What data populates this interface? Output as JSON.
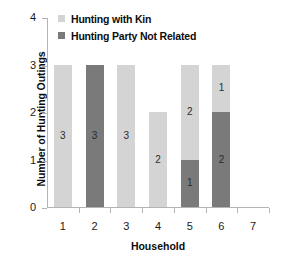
{
  "chart_data": {
    "type": "bar",
    "subtype": "stacked-bar",
    "title": "",
    "xlabel": "Household",
    "ylabel": "Number of Hunting Outings",
    "categories": [
      "1",
      "2",
      "3",
      "4",
      "5",
      "6",
      "7"
    ],
    "series": [
      {
        "name": "Hunting Party Not Related",
        "color": "#7a7a7a",
        "values": [
          0,
          3,
          0,
          0,
          1,
          2,
          0
        ]
      },
      {
        "name": "Hunting with Kin",
        "color": "#d4d4d4",
        "values": [
          3,
          0,
          3,
          2,
          2,
          1,
          0
        ]
      }
    ],
    "stack_order_bottom_to_top": [
      "Hunting Party Not Related",
      "Hunting with Kin"
    ],
    "ylim": [
      0,
      4
    ],
    "yticks": [
      "0",
      "1",
      "2",
      "3",
      "4"
    ],
    "xticks": [
      "1",
      "2",
      "3",
      "4",
      "5",
      "6",
      "7"
    ],
    "grid": false,
    "legend_position": "top-left-inside",
    "bar_totals": [
      3,
      3,
      3,
      2,
      3,
      3,
      0
    ],
    "segment_labels": [
      [
        {
          "value": "3",
          "series": "Hunting with Kin"
        }
      ],
      [
        {
          "value": "3",
          "series": "Hunting Party Not Related"
        }
      ],
      [
        {
          "value": "3",
          "series": "Hunting with Kin"
        }
      ],
      [
        {
          "value": "2",
          "series": "Hunting with Kin"
        }
      ],
      [
        {
          "value": "1",
          "series": "Hunting Party Not Related"
        },
        {
          "value": "2",
          "series": "Hunting with Kin"
        }
      ],
      [
        {
          "value": "2",
          "series": "Hunting Party Not Related"
        },
        {
          "value": "1",
          "series": "Hunting with Kin"
        }
      ],
      []
    ]
  },
  "legend": {
    "items": [
      {
        "label": "Hunting with Kin",
        "color": "#d4d4d4"
      },
      {
        "label": "Hunting Party Not Related",
        "color": "#7a7a7a"
      }
    ]
  },
  "axes": {
    "y_title": "Number of Hunting Outings",
    "x_title": "Household",
    "y_tick_labels": [
      "0",
      "1",
      "2",
      "3",
      "4"
    ],
    "x_tick_labels": [
      "1",
      "2",
      "3",
      "4",
      "5",
      "6",
      "7"
    ]
  },
  "colors": {
    "kin": "#d4d4d4",
    "non_kin": "#7a7a7a",
    "axis": "#b4b4b4",
    "text": "#1a1a1a",
    "background": "#ffffff"
  }
}
